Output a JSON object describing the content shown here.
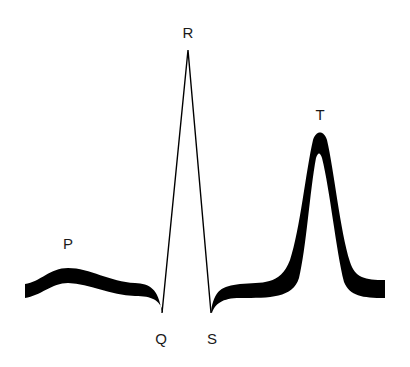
{
  "diagram": {
    "colors": {
      "background": "#ffffff",
      "stroke": "#000000",
      "label": "#1a1a1a"
    },
    "labels": {
      "P": "P",
      "Q": "Q",
      "R": "R",
      "S": "S",
      "T": "T"
    }
  }
}
